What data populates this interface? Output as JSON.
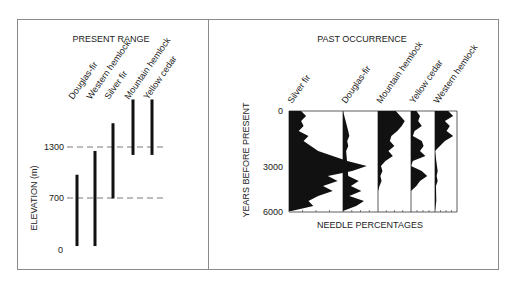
{
  "left_panel": {
    "title": "PRESENT RANGE",
    "ylabel": "ELEVATION (m)",
    "ticks": [
      "0",
      "700",
      "1300"
    ]
  },
  "right_panel": {
    "title": "PAST OCCURRENCE",
    "ylabel": "YEARS BEFORE PRESENT",
    "xlabel": "NEEDLE PERCENTAGES",
    "ticks": [
      "0",
      "3000",
      "6000"
    ]
  },
  "chart_data": [
    {
      "type": "range-bar",
      "title": "PRESENT RANGE",
      "xlabel": "",
      "ylabel": "ELEVATION (m)",
      "categories": [
        "Douglas-fir",
        "Western hemlock",
        "Silver fir",
        "Mountain hemlock",
        "Yellow cedar"
      ],
      "ranges": [
        [
          50,
          950
        ],
        [
          50,
          1250
        ],
        [
          650,
          1600
        ],
        [
          1200,
          1900
        ],
        [
          1200,
          1900
        ]
      ],
      "reference_lines": [
        700,
        1300
      ],
      "yticks": [
        0,
        700,
        1300
      ],
      "ylim": [
        0,
        1900
      ]
    },
    {
      "type": "area",
      "title": "PAST OCCURRENCE",
      "xlabel": "NEEDLE PERCENTAGES",
      "ylabel": "YEARS BEFORE PRESENT",
      "yticks": [
        0,
        3000,
        6000
      ],
      "ylim": [
        0,
        6000
      ],
      "y_inverted": true,
      "series": [
        {
          "name": "Silver fir",
          "depth": [
            0,
            300,
            600,
            900,
            1200,
            1500,
            1800,
            2100,
            2400,
            2700,
            3000,
            3300,
            3600,
            3900,
            4200,
            4500,
            4800,
            5100,
            5400,
            5700,
            6000
          ],
          "values": [
            25,
            35,
            25,
            30,
            20,
            40,
            30,
            45,
            60,
            90,
            120,
            160,
            130,
            80,
            100,
            70,
            90,
            60,
            40,
            50,
            5
          ]
        },
        {
          "name": "Douglas-fir",
          "depth": [
            0,
            1200,
            1500,
            1800,
            2100,
            2400,
            3900,
            4200,
            4500,
            4800,
            5100,
            5400,
            5700,
            6000
          ],
          "values": [
            0,
            10,
            12,
            8,
            10,
            6,
            10,
            30,
            15,
            35,
            12,
            40,
            25,
            0
          ]
        },
        {
          "name": "Mountain hemlock",
          "depth": [
            0,
            300,
            600,
            900,
            1200,
            1500,
            1800,
            2100,
            2400,
            2700,
            3000,
            3300,
            3600,
            3900,
            4200,
            4500,
            4800
          ],
          "values": [
            60,
            75,
            90,
            80,
            65,
            45,
            40,
            55,
            35,
            50,
            25,
            10,
            15,
            8,
            12,
            5,
            0
          ]
        },
        {
          "name": "Yellow cedar",
          "depth": [
            0,
            300,
            600,
            900,
            1200,
            1500,
            1800,
            2100,
            2400,
            2700,
            3000,
            3300,
            3600,
            3900,
            4200,
            4500,
            4800
          ],
          "values": [
            15,
            25,
            20,
            30,
            10,
            5,
            30,
            35,
            25,
            40,
            5,
            0,
            30,
            45,
            25,
            15,
            0
          ]
        },
        {
          "name": "Western hemlock",
          "depth": [
            0,
            300,
            600,
            900,
            1200,
            1500,
            1800,
            2100,
            2400,
            3600,
            3900,
            4200,
            4500,
            5400,
            5700,
            6000
          ],
          "values": [
            40,
            55,
            30,
            45,
            35,
            55,
            30,
            15,
            0,
            8,
            5,
            8,
            3,
            4,
            2,
            0
          ]
        }
      ]
    }
  ]
}
